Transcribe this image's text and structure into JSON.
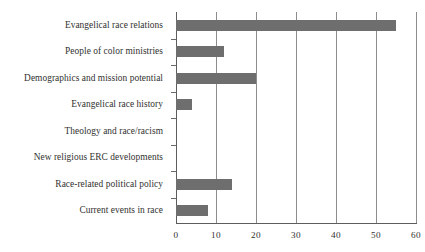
{
  "figure": {
    "clipped_caption_text": "",
    "bar_color": "#6e6e6e",
    "grid_color": "#8d8d8d",
    "axis_color": "#5d5d5d",
    "text_color": "#31312f"
  },
  "chart_data": {
    "type": "bar",
    "orientation": "horizontal",
    "title": "",
    "subtitle": "",
    "xlabel": "",
    "ylabel": "",
    "categories": [
      "Evangelical race relations",
      "People of color ministries",
      "Demographics and mission potential",
      "Evangelical race history",
      "Theology and race/racism",
      "New religious ERC developments",
      "Race-related political policy",
      "Current events in race"
    ],
    "values": [
      55,
      12,
      20,
      4,
      0,
      0,
      14,
      8
    ],
    "xlim": [
      0,
      60
    ],
    "xticks": [
      0,
      10,
      20,
      30,
      40,
      50,
      60
    ],
    "xtick_labels": [
      "0",
      "10",
      "20",
      "30",
      "40",
      "50",
      "60"
    ],
    "grid": "vertical",
    "legend": "none"
  }
}
